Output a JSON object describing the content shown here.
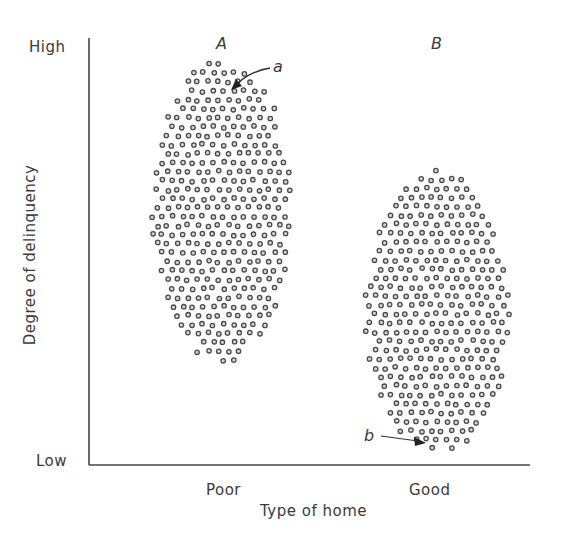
{
  "chart_data": {
    "type": "scatter",
    "title": "",
    "xlabel": "Type of home",
    "ylabel": "Degree of delinquency",
    "categories": [
      "Poor",
      "Good"
    ],
    "y_tick_labels": {
      "top": "High",
      "bottom": "Low"
    },
    "grid": false,
    "legend": null,
    "series": [
      {
        "name": "A",
        "category": "Poor",
        "shape": "ellipse cluster of points",
        "center_relative": {
          "x": 0.3,
          "y_high_to_low": 0.4
        },
        "y_range_relative": [
          0.23,
          0.96
        ],
        "annotation": {
          "label": "a",
          "points_to": "highest-delinquency individual at top of cluster A"
        }
      },
      {
        "name": "B",
        "category": "Good",
        "shape": "ellipse cluster of points",
        "center_relative": {
          "x": 0.8,
          "y_high_to_low": 0.64
        },
        "y_range_relative": [
          0.02,
          0.69
        ],
        "annotation": {
          "label": "b",
          "points_to": "lowest-delinquency individual at bottom of cluster B"
        }
      }
    ]
  },
  "axes": {
    "y_high": "High",
    "y_low": "Low",
    "y_title": "Degree of delinquency",
    "x_title": "Type of home",
    "x_ticks": [
      "Poor",
      "Good"
    ]
  },
  "groups": {
    "a_label": "A",
    "b_label": "B"
  },
  "annotations": {
    "a": "a",
    "b": "b"
  },
  "colors": {
    "ink": "#3a3a3a",
    "dot_ring": "#4a4a4a",
    "dot_fill": "#d8d8d8",
    "background": "#ffffff"
  }
}
